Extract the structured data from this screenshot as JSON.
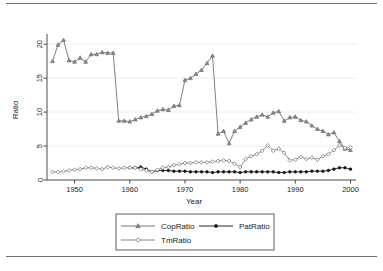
{
  "chart_data": {
    "type": "line",
    "title": "",
    "xlabel": "Year",
    "ylabel": "Ratio",
    "xlim": [
      1945,
      2001
    ],
    "ylim": [
      0,
      21.5
    ],
    "xticks": [
      1950,
      1960,
      1970,
      1980,
      1990,
      2000
    ],
    "yticks": [
      0,
      5,
      10,
      15,
      20
    ],
    "grid": "horizontal",
    "legend_position": "bottom-center",
    "legend": [
      "CopRatio",
      "PatRatio",
      "TmRatio"
    ],
    "x": [
      1946,
      1947,
      1948,
      1949,
      1950,
      1951,
      1952,
      1953,
      1954,
      1955,
      1956,
      1957,
      1958,
      1959,
      1960,
      1961,
      1962,
      1963,
      1964,
      1965,
      1966,
      1967,
      1968,
      1969,
      1970,
      1971,
      1972,
      1973,
      1974,
      1975,
      1976,
      1977,
      1978,
      1979,
      1980,
      1981,
      1982,
      1983,
      1984,
      1985,
      1986,
      1987,
      1988,
      1989,
      1990,
      1991,
      1992,
      1993,
      1994,
      1995,
      1996,
      1997,
      1998,
      1999,
      2000
    ],
    "series": [
      {
        "name": "CopRatio",
        "marker": "triangle",
        "color": "#6a6a6e",
        "fill": "#8e8e92",
        "values": [
          17.5,
          19.9,
          20.6,
          17.6,
          17.4,
          18.0,
          17.4,
          18.5,
          18.5,
          18.8,
          18.7,
          18.7,
          8.7,
          8.7,
          8.6,
          8.9,
          9.2,
          9.4,
          9.7,
          10.2,
          10.4,
          10.3,
          10.9,
          11.0,
          14.7,
          15.0,
          15.6,
          16.2,
          17.2,
          18.3,
          6.8,
          7.2,
          5.4,
          7.2,
          7.8,
          8.4,
          8.9,
          9.3,
          9.6,
          9.3,
          9.9,
          10.1,
          8.7,
          9.2,
          9.3,
          8.8,
          8.6,
          8.0,
          7.5,
          7.2,
          6.7,
          7.0,
          5.7,
          4.6,
          4.4
        ]
      },
      {
        "name": "PatRatio",
        "marker": "circle",
        "color": "#111111",
        "fill": "#111111",
        "values": [
          null,
          null,
          null,
          null,
          null,
          null,
          null,
          null,
          null,
          null,
          null,
          null,
          null,
          null,
          1.8,
          1.8,
          1.9,
          1.6,
          1.2,
          1.4,
          1.4,
          1.4,
          1.3,
          1.3,
          1.3,
          1.2,
          1.2,
          1.2,
          1.2,
          1.1,
          1.2,
          1.2,
          1.2,
          1.2,
          1.1,
          1.2,
          1.2,
          1.2,
          1.2,
          1.2,
          1.2,
          1.1,
          1.1,
          1.2,
          1.2,
          1.2,
          1.2,
          1.3,
          1.3,
          1.3,
          1.4,
          1.6,
          1.8,
          1.8,
          1.6
        ]
      },
      {
        "name": "TmRatio",
        "marker": "diamond",
        "color": "#7a7a7e",
        "fill": "#ffffff",
        "values": [
          1.2,
          1.2,
          1.3,
          1.4,
          1.5,
          1.6,
          1.8,
          1.8,
          1.7,
          1.6,
          1.9,
          1.8,
          1.7,
          1.8,
          1.8,
          1.8,
          1.6,
          1.4,
          1.2,
          1.5,
          1.8,
          1.9,
          2.2,
          2.3,
          2.5,
          2.5,
          2.6,
          2.6,
          2.6,
          2.7,
          2.8,
          2.9,
          2.8,
          2.4,
          1.9,
          3.1,
          3.5,
          3.8,
          4.3,
          5.1,
          4.3,
          4.6,
          4.0,
          2.9,
          3.0,
          3.4,
          3.1,
          3.3,
          3.0,
          3.5,
          3.8,
          4.4,
          5.1,
          4.7,
          4.8
        ]
      }
    ]
  }
}
